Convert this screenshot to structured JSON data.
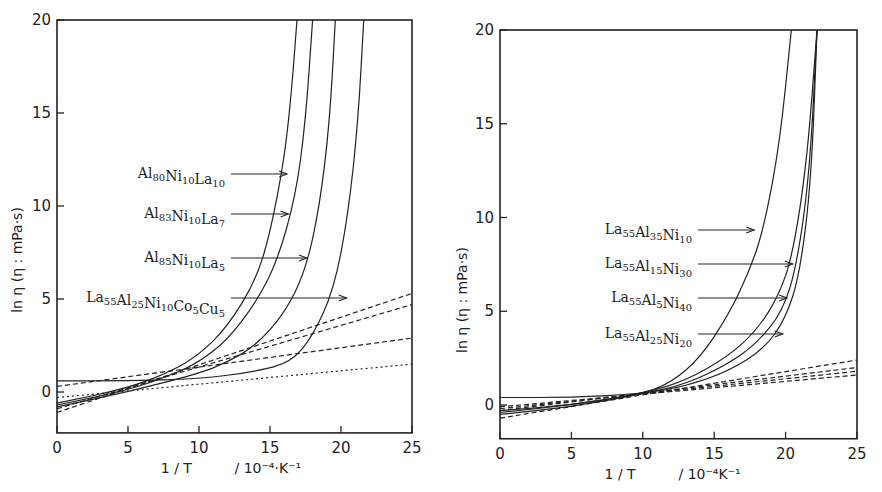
{
  "chart_data": [
    {
      "type": "line",
      "title": "",
      "xlabel": "1 / T",
      "xunit": "/ 10^-4·K^-1",
      "xunit_display": "/ 10⁻⁴·K⁻¹",
      "ylabel": "ln η (η : mPa·s)",
      "xlim": [
        0,
        25
      ],
      "ylim": [
        -2.2,
        20
      ],
      "xticks": [
        0,
        5,
        10,
        15,
        20,
        25
      ],
      "yticks": [
        0,
        5,
        10,
        15,
        20
      ],
      "grid": false,
      "legend": "inline arrow labels",
      "series": [
        {
          "name": "Al80Ni10La10",
          "style": "solid",
          "x": [
            0,
            5,
            8,
            10,
            12,
            14,
            15,
            16,
            16.5,
            16.9
          ],
          "y": [
            -0.6,
            0.2,
            1.1,
            2.0,
            3.5,
            6.0,
            8.5,
            12.5,
            16.0,
            20
          ]
        },
        {
          "name": "Al83Ni10La7",
          "style": "solid",
          "x": [
            0,
            5,
            8,
            10,
            12,
            14,
            15.5,
            16.8,
            17.5,
            18.0
          ],
          "y": [
            -0.7,
            0.1,
            0.9,
            1.6,
            2.8,
            4.8,
            7.0,
            10.5,
            14.5,
            20
          ]
        },
        {
          "name": "Al85Ni10La5",
          "style": "solid",
          "x": [
            0,
            5,
            10,
            12,
            14,
            16,
            17.5,
            18.5,
            19.2,
            19.6
          ],
          "y": [
            -0.8,
            0.0,
            1.0,
            1.6,
            2.5,
            4.2,
            6.5,
            10.0,
            14.5,
            20
          ]
        },
        {
          "name": "La55Al25Ni10Co5Cu5",
          "style": "solid",
          "x": [
            0,
            5,
            10,
            14,
            16.5,
            18,
            19.5,
            20.5,
            21.2,
            21.6
          ],
          "y": [
            0.6,
            0.6,
            0.7,
            1.1,
            1.6,
            3.0,
            5.5,
            9.5,
            14.5,
            20
          ]
        },
        {
          "name": "Arrhenius fit 1",
          "style": "dashed",
          "x": [
            0,
            25
          ],
          "y": [
            -1.1,
            5.3
          ]
        },
        {
          "name": "Arrhenius fit 2",
          "style": "dashed",
          "x": [
            0,
            25
          ],
          "y": [
            -0.9,
            4.7
          ]
        },
        {
          "name": "Arrhenius fit 3",
          "style": "dashed",
          "x": [
            0,
            25
          ],
          "y": [
            0.3,
            2.9
          ]
        },
        {
          "name": "Arrhenius fit 4",
          "style": "dotted",
          "x": [
            0,
            25
          ],
          "y": [
            -0.3,
            1.5
          ]
        }
      ],
      "annotations": [
        {
          "text": "Al80Ni10La10",
          "parts": [
            [
              "Al",
              ""
            ],
            [
              "80",
              "sub"
            ],
            [
              "Ni",
              ""
            ],
            [
              "10",
              "sub"
            ],
            [
              "La",
              ""
            ],
            [
              "10",
              "sub"
            ]
          ],
          "arrow_to": [
            16.2,
            10.3
          ]
        },
        {
          "text": "Al83Ni10La7",
          "parts": [
            [
              "Al",
              ""
            ],
            [
              "83",
              "sub"
            ],
            [
              "Ni",
              ""
            ],
            [
              "10",
              "sub"
            ],
            [
              "La",
              ""
            ],
            [
              "7",
              "sub"
            ]
          ],
          "arrow_to": [
            16.3,
            8.3
          ]
        },
        {
          "text": "Al85Ni10La5",
          "parts": [
            [
              "Al",
              ""
            ],
            [
              "85",
              "sub"
            ],
            [
              "Ni",
              ""
            ],
            [
              "10",
              "sub"
            ],
            [
              "La",
              ""
            ],
            [
              "5",
              "sub"
            ]
          ],
          "arrow_to": [
            17.6,
            6.5
          ]
        },
        {
          "text": "La55Al25Ni10Co5Cu5",
          "parts": [
            [
              "La",
              ""
            ],
            [
              "55",
              "sub"
            ],
            [
              "Al",
              ""
            ],
            [
              "25",
              "sub"
            ],
            [
              "Ni",
              ""
            ],
            [
              "10",
              "sub"
            ],
            [
              "Co",
              ""
            ],
            [
              "5",
              "sub"
            ],
            [
              "Cu",
              ""
            ],
            [
              "5",
              "sub"
            ]
          ],
          "arrow_to": [
            20.4,
            4.8
          ]
        }
      ]
    },
    {
      "type": "line",
      "title": "",
      "xlabel": "1 / T",
      "xunit": "/ 10^-4K^-1",
      "xunit_display": "/ 10⁻⁴K⁻¹",
      "ylabel": "ln η (η : mPa·s)",
      "xlim": [
        0,
        25
      ],
      "ylim": [
        -1.8,
        20
      ],
      "xticks": [
        0,
        5,
        10,
        15,
        20,
        25
      ],
      "yticks": [
        0,
        5,
        10,
        15,
        20
      ],
      "grid": false,
      "legend": "inline arrow labels",
      "series": [
        {
          "name": "La55Al35Ni10",
          "style": "solid",
          "x": [
            0,
            5,
            10,
            12,
            14,
            16,
            17.5,
            18.5,
            19.6,
            20.4
          ],
          "y": [
            -0.3,
            0.0,
            0.6,
            1.2,
            2.5,
            4.8,
            7.2,
            9.5,
            14.0,
            20
          ]
        },
        {
          "name": "La55Al15Ni30",
          "style": "solid",
          "x": [
            0,
            5,
            10,
            13,
            16,
            18,
            19.5,
            20.5,
            21.5,
            22.2
          ],
          "y": [
            -0.4,
            0.0,
            0.6,
            1.3,
            2.6,
            4.0,
            5.8,
            8.0,
            13.0,
            20
          ]
        },
        {
          "name": "La55Al5Ni40",
          "style": "solid",
          "x": [
            0,
            5,
            10,
            13,
            16,
            18,
            19.8,
            20.8,
            21.7,
            22.2
          ],
          "y": [
            -0.5,
            -0.1,
            0.6,
            1.1,
            2.2,
            3.3,
            5.0,
            7.5,
            12.5,
            20
          ]
        },
        {
          "name": "La55Al25Ni20",
          "style": "solid",
          "x": [
            0,
            5,
            10,
            13,
            16,
            18.5,
            20,
            21,
            21.8,
            22.2
          ],
          "y": [
            0.4,
            0.4,
            0.6,
            1.0,
            1.8,
            3.0,
            4.6,
            7.0,
            12.0,
            20
          ]
        },
        {
          "name": "Arrhenius fit 1",
          "style": "dashed",
          "x": [
            0,
            25
          ],
          "y": [
            -0.7,
            2.4
          ]
        },
        {
          "name": "Arrhenius fit 2",
          "style": "dashed",
          "x": [
            0,
            25
          ],
          "y": [
            -0.3,
            2.0
          ]
        },
        {
          "name": "Arrhenius fit 3",
          "style": "dashed",
          "x": [
            0,
            25
          ],
          "y": [
            -0.2,
            1.8
          ]
        },
        {
          "name": "Arrhenius fit 4",
          "style": "dashed",
          "x": [
            0,
            25
          ],
          "y": [
            -0.1,
            1.6
          ]
        }
      ],
      "annotations": [
        {
          "text": "La55Al35Ni10",
          "parts": [
            [
              "La",
              ""
            ],
            [
              "55",
              "sub"
            ],
            [
              "Al",
              ""
            ],
            [
              "35",
              "sub"
            ],
            [
              "Ni",
              ""
            ],
            [
              "10",
              "sub"
            ]
          ],
          "arrow_to": [
            17.8,
            9.8
          ]
        },
        {
          "text": "La55Al15Ni30",
          "parts": [
            [
              "La",
              ""
            ],
            [
              "55",
              "sub"
            ],
            [
              "Al",
              ""
            ],
            [
              "15",
              "sub"
            ],
            [
              "Ni",
              ""
            ],
            [
              "30",
              "sub"
            ]
          ],
          "arrow_to": [
            20.5,
            7.9
          ]
        },
        {
          "text": "La55Al5Ni40",
          "parts": [
            [
              "La",
              ""
            ],
            [
              "55",
              "sub"
            ],
            [
              "Al",
              ""
            ],
            [
              "5",
              "sub"
            ],
            [
              "Ni",
              ""
            ],
            [
              "40",
              "sub"
            ]
          ],
          "arrow_to": [
            20.1,
            5.9
          ]
        },
        {
          "text": "La55Al25Ni20",
          "parts": [
            [
              "La",
              ""
            ],
            [
              "55",
              "sub"
            ],
            [
              "Al",
              ""
            ],
            [
              "25",
              "sub"
            ],
            [
              "Ni",
              ""
            ],
            [
              "20",
              "sub"
            ]
          ],
          "arrow_to": [
            19.8,
            4.1
          ]
        }
      ]
    }
  ],
  "layout": {
    "panels": [
      {
        "x0": 57,
        "x1": 412,
        "y_at_20": 20,
        "y_at_0": 392,
        "label_right_x": 225,
        "label_ys": [
          178,
          218,
          262,
          302
        ],
        "ylabel_x": 22,
        "ylabel_y": 260
      },
      {
        "x0": 500,
        "x1": 857,
        "y_at_20": 30,
        "y_at_0": 405,
        "label_right_x": 692,
        "label_ys": [
          234,
          268,
          302,
          338
        ],
        "ylabel_x": 467,
        "ylabel_y": 300
      }
    ]
  }
}
